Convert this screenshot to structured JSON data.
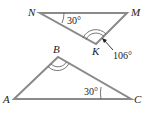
{
  "colors": {
    "line": "#8a8a8a",
    "text": "#222222"
  },
  "triangles": [
    {
      "name": "NMK",
      "vertices": [
        {
          "label": "N",
          "x": 40,
          "y": 13
        },
        {
          "label": "M",
          "x": 127,
          "y": 13
        },
        {
          "label": "K",
          "x": 96,
          "y": 44
        }
      ],
      "angles": [
        {
          "at": "N",
          "label": "30°"
        },
        {
          "at": "K",
          "label": "106°",
          "marks": 2
        }
      ]
    },
    {
      "name": "ABC",
      "vertices": [
        {
          "label": "A",
          "x": 14,
          "y": 99
        },
        {
          "label": "B",
          "x": 58,
          "y": 57
        },
        {
          "label": "C",
          "x": 131,
          "y": 99
        }
      ],
      "angles": [
        {
          "at": "B",
          "label": "",
          "marks": 2
        },
        {
          "at": "C",
          "label": "30°"
        }
      ]
    }
  ],
  "labels": {
    "N": "N",
    "M": "M",
    "K": "K",
    "A": "A",
    "B": "B",
    "C": "C",
    "angle_N": "30°",
    "angle_K": "106°",
    "angle_C": "30°"
  }
}
